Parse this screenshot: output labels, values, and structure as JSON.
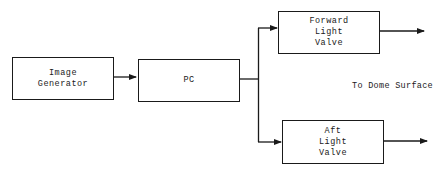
{
  "diagram": {
    "type": "block-diagram",
    "blocks": {
      "image_generator": {
        "lines": [
          "Image",
          "Generator"
        ]
      },
      "pc": {
        "lines": [
          "PC"
        ]
      },
      "forward_light_valve": {
        "lines": [
          "Forward",
          "Light",
          "Valve"
        ]
      },
      "aft_light_valve": {
        "lines": [
          "Aft",
          "Light",
          "Valve"
        ]
      }
    },
    "annotation": "To Dome Surface",
    "connections": [
      {
        "from": "Image Generator",
        "to": "PC"
      },
      {
        "from": "PC",
        "to": "Forward Light Valve"
      },
      {
        "from": "PC",
        "to": "Aft Light Valve"
      },
      {
        "from": "Forward Light Valve",
        "to": "Dome Surface"
      },
      {
        "from": "Aft Light Valve",
        "to": "Dome Surface"
      }
    ],
    "colors": {
      "line": "#1a1a1a",
      "background": "#ffffff"
    }
  }
}
